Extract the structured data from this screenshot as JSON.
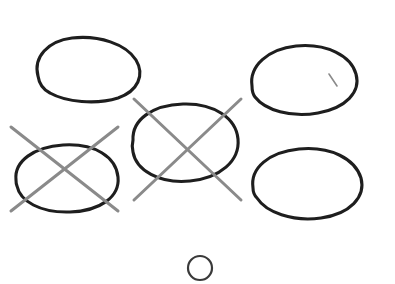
{
  "canvas": {
    "title": "Hand-drawn ellipses with cross-out marks",
    "width": 395,
    "height": 284,
    "background_color": "#ffffff"
  },
  "style": {
    "ellipse_stroke_color": "#1e1e1e",
    "ellipse_stroke_width": 3.1,
    "small_circle_stroke_color": "#3a3a3a",
    "small_circle_stroke_width": 2.2,
    "cross_stroke_color": "#8a8a8a",
    "cross_stroke_width": 3.0,
    "tick_stroke_color": "#8a8a8a",
    "tick_stroke_width": 1.6
  },
  "shapes": {
    "ellipses": [
      {
        "id": "ellipse-top-left",
        "label": "Top-left ellipse",
        "cx": 86,
        "cy": 69,
        "rx": 52,
        "ry": 31,
        "rotation": -4,
        "crossed_out": false,
        "path": "M 38 76 C 33 57 48 41 72 38 C 99 35 126 44 136 60 C 145 75 138 91 118 98 C 96 105 66 102 50 93 C 42 89 39 83 38 76 Z"
      },
      {
        "id": "ellipse-top-right",
        "label": "Top-right ellipse",
        "cx": 304,
        "cy": 79,
        "rx": 54,
        "ry": 34,
        "rotation": 3,
        "crossed_out": false,
        "path": "M 252 86 C 249 66 268 49 296 46 C 327 43 351 56 356 74 C 361 92 346 108 318 113 C 291 118 265 110 255 97 C 252 93 252 90 252 86 Z"
      },
      {
        "id": "ellipse-center",
        "label": "Center ellipse",
        "cx": 185,
        "cy": 143,
        "rx": 53,
        "ry": 39,
        "rotation": 0,
        "crossed_out": true,
        "path": "M 133 140 C 132 120 152 105 183 104 C 214 103 236 118 238 139 C 240 161 220 178 190 181 C 159 184 136 170 133 152 C 132 148 132 144 133 140 Z"
      },
      {
        "id": "ellipse-bottom-left",
        "label": "Bottom-left ellipse",
        "cx": 67,
        "cy": 179,
        "rx": 52,
        "ry": 34,
        "rotation": -6,
        "crossed_out": true,
        "path": "M 16 180 C 14 161 34 147 63 145 C 95 143 116 157 118 177 C 120 197 100 211 70 212 C 40 213 20 201 17 186 C 16 184 16 182 16 180 Z"
      },
      {
        "id": "ellipse-bottom-right",
        "label": "Bottom-right ellipse",
        "cx": 307,
        "cy": 183,
        "rx": 55,
        "ry": 35,
        "rotation": 2,
        "crossed_out": false,
        "path": "M 253 188 C 250 168 269 152 299 149 C 331 146 355 159 361 178 C 366 197 350 214 321 218 C 292 222 266 212 257 198 C 254 195 253 191 253 188 Z"
      }
    ],
    "small_circle": {
      "id": "small-circle-bottom",
      "label": "Small circle",
      "cx": 200,
      "cy": 268,
      "r": 12
    },
    "cross_marks": [
      {
        "id": "cross-center",
        "label": "Cross over center ellipse",
        "over": "ellipse-center",
        "lines": [
          {
            "x1": 134,
            "y1": 99,
            "x2": 241,
            "y2": 200
          },
          {
            "x1": 134,
            "y1": 200,
            "x2": 241,
            "y2": 99
          }
        ]
      },
      {
        "id": "cross-bottom-left",
        "label": "Cross over bottom-left ellipse",
        "over": "ellipse-bottom-left",
        "lines": [
          {
            "x1": 11,
            "y1": 127,
            "x2": 118,
            "y2": 211
          },
          {
            "x1": 11,
            "y1": 211,
            "x2": 118,
            "y2": 127
          }
        ]
      }
    ],
    "tick_marks": [
      {
        "id": "tick-top-right",
        "label": "Small tick inside top-right ellipse",
        "inside": "ellipse-top-right",
        "x1": 329,
        "y1": 74,
        "x2": 337,
        "y2": 86
      }
    ]
  }
}
